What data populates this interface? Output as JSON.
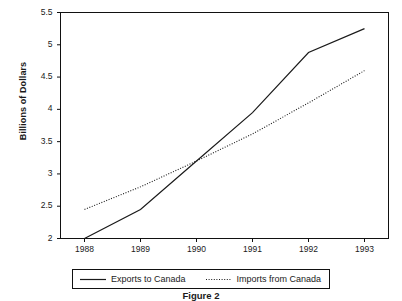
{
  "chart_data": {
    "type": "line",
    "title": "",
    "subtitle": "",
    "xlabel": "",
    "ylabel": "Billions of Dollars",
    "x": [
      "1988",
      "1989",
      "1990",
      "1991",
      "1992",
      "1993"
    ],
    "xtick_labels": [
      "1988",
      "1989",
      "1990",
      "1991",
      "1992",
      "1993"
    ],
    "ytick_labels": [
      "2",
      "2.5",
      "3",
      "3.5",
      "4",
      "4.5",
      "5",
      "5.5"
    ],
    "ytick_values": [
      2,
      2.5,
      3,
      3.5,
      4,
      4.5,
      5,
      5.5
    ],
    "ylim": [
      2,
      5.5
    ],
    "xlim": [
      1988,
      1993
    ],
    "grid": false,
    "legend_position": "below-axis",
    "series": [
      {
        "name": "Exports to Canada",
        "style": "solid",
        "color": "#1a1a1a",
        "values": [
          2.0,
          2.45,
          3.2,
          3.95,
          4.88,
          5.25
        ]
      },
      {
        "name": "Imports from Canada",
        "style": "dotted",
        "color": "#1a1a1a",
        "values": [
          2.45,
          2.8,
          3.2,
          3.62,
          4.1,
          4.6
        ]
      }
    ]
  },
  "axis": {
    "y_title": "Billions of Dollars"
  },
  "legend": {
    "entries": [
      {
        "label": "Exports to Canada",
        "style": "solid"
      },
      {
        "label": "Imports from Canada",
        "style": "dotted"
      }
    ]
  },
  "caption": {
    "text": "Figure 2"
  },
  "colors": {
    "line": "#1a1a1a",
    "frame": "#111111",
    "background": "#ffffff"
  }
}
